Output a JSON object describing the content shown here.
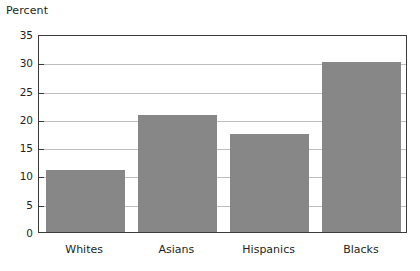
{
  "chart_data": {
    "type": "bar",
    "title": "",
    "subtitle": "",
    "xlabel": "",
    "ylabel": "Percent",
    "categories": [
      "Whites",
      "Asians",
      "Hispanics",
      "Blacks"
    ],
    "values": [
      10.9,
      20.7,
      17.3,
      30.0
    ],
    "series": [
      {
        "name": "Percent",
        "values": [
          10.9,
          20.7,
          17.3,
          30.0
        ]
      }
    ],
    "ylim": [
      0,
      35
    ],
    "ytick_labels": [
      "0",
      "5",
      "10",
      "15",
      "20",
      "25",
      "30",
      "35"
    ],
    "ytick_values": [
      0,
      5,
      10,
      15,
      20,
      25,
      30,
      35
    ],
    "grid": true,
    "grid_axis": "y",
    "legend": false,
    "legend_position": "none",
    "bar_color": "#878787",
    "frame_color": "#3a3a3a",
    "grid_color": "#bdbdbd",
    "text_color": "#231f20",
    "background": "#ffffff",
    "annotations": []
  }
}
